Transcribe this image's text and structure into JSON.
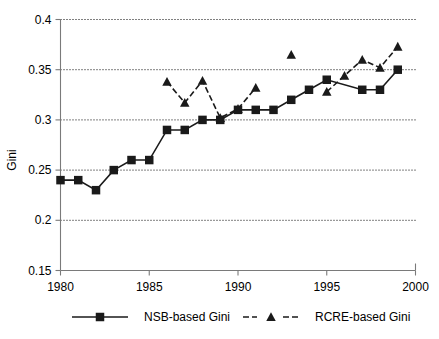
{
  "chart_data": {
    "type": "line",
    "title": "",
    "xlabel": "",
    "ylabel": "Gini",
    "xlim": [
      1980,
      2000
    ],
    "ylim": [
      0.15,
      0.4
    ],
    "grid": true,
    "grid_axis": "y",
    "legend_position": "bottom",
    "x_ticks": [
      1980,
      1985,
      1990,
      1995,
      2000
    ],
    "x_tick_labels": [
      "1980",
      "1985",
      "1990",
      "1995",
      "2000"
    ],
    "y_ticks": [
      0.15,
      0.2,
      0.25,
      0.3,
      0.35,
      0.4
    ],
    "y_tick_labels": [
      "0.15",
      "0.2",
      "0.25",
      "0.3",
      "0.35",
      "0.4"
    ],
    "series": [
      {
        "name": "NSB-based Gini",
        "marker": "square",
        "linestyle": "solid",
        "color": "#1a1a1a",
        "x": [
          1980,
          1981,
          1982,
          1983,
          1984,
          1985,
          1986,
          1987,
          1988,
          1989,
          1990,
          1991,
          1992,
          1993,
          1994,
          1995,
          1997,
          1998,
          1999
        ],
        "values": [
          0.24,
          0.24,
          0.23,
          0.25,
          0.26,
          0.26,
          0.29,
          0.29,
          0.3,
          0.3,
          0.31,
          0.31,
          0.31,
          0.32,
          0.33,
          0.34,
          0.33,
          0.33,
          0.35
        ]
      },
      {
        "name": "RCRE-based Gini",
        "marker": "triangle",
        "linestyle": "dashed",
        "color": "#1a1a1a",
        "x": [
          1986,
          1987,
          1988,
          1989,
          1990,
          1991,
          1993,
          1995,
          1996,
          1997,
          1998,
          1999
        ],
        "values": [
          0.338,
          0.317,
          0.339,
          0.302,
          0.311,
          0.332,
          0.365,
          0.328,
          0.344,
          0.36,
          0.352,
          0.373
        ],
        "segments": [
          [
            1986,
            1987,
            1988,
            1989,
            1990,
            1991
          ],
          [
            1995,
            1996,
            1997,
            1998,
            1999
          ]
        ],
        "isolated_points": [
          1993
        ]
      }
    ]
  },
  "legend": {
    "items": [
      {
        "label": "NSB-based Gini",
        "marker": "square",
        "linestyle": "solid"
      },
      {
        "label": "RCRE-based Gini",
        "marker": "triangle",
        "linestyle": "dashed"
      }
    ]
  },
  "axis": {
    "y_title": "Gini"
  }
}
